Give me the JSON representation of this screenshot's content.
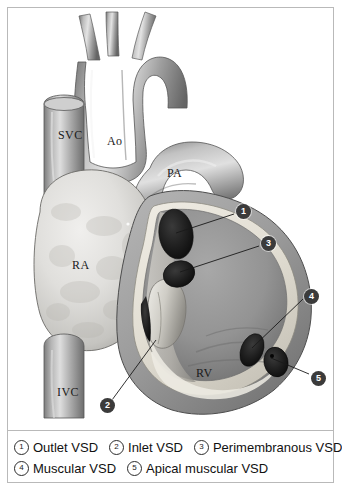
{
  "figure": {
    "frame_color": "#b9b9b9",
    "background": "#ffffff"
  },
  "anatomy_labels": [
    {
      "id": "svc",
      "text": "SVC",
      "x": 58,
      "y": 128
    },
    {
      "id": "ao",
      "text": "Ao",
      "x": 107,
      "y": 134
    },
    {
      "id": "pa",
      "text": "PA",
      "x": 167,
      "y": 166
    },
    {
      "id": "ra",
      "text": "RA",
      "x": 72,
      "y": 258
    },
    {
      "id": "ivc",
      "text": "IVC",
      "x": 57,
      "y": 385
    },
    {
      "id": "rv",
      "text": "RV",
      "x": 196,
      "y": 366
    }
  ],
  "callouts": [
    {
      "num": "1",
      "x": 236,
      "y": 204,
      "line": {
        "x1": 234,
        "y1": 214,
        "x2": 176,
        "y2": 233
      }
    },
    {
      "num": "2",
      "x": 100,
      "y": 398,
      "line": {
        "x1": 112,
        "y1": 400,
        "x2": 156,
        "y2": 340
      }
    },
    {
      "num": "3",
      "x": 261,
      "y": 236,
      "line": {
        "x1": 259,
        "y1": 246,
        "x2": 180,
        "y2": 272
      }
    },
    {
      "num": "4",
      "x": 304,
      "y": 289,
      "line": {
        "x1": 303,
        "y1": 299,
        "x2": 252,
        "y2": 348
      }
    },
    {
      "num": "5",
      "x": 311,
      "y": 371,
      "line": {
        "x1": 309,
        "y1": 374,
        "x2": 271,
        "y2": 358
      }
    }
  ],
  "legend": {
    "rows": [
      [
        {
          "num": "1",
          "label": "Outlet VSD"
        },
        {
          "num": "2",
          "label": "Inlet VSD"
        },
        {
          "num": "3",
          "label": "Perimembranous VSD"
        }
      ],
      [
        {
          "num": "4",
          "label": "Muscular VSD"
        },
        {
          "num": "5",
          "label": "Apical muscular VSD"
        }
      ]
    ]
  },
  "colors": {
    "vessel_light": "#d8d8d8",
    "vessel_mid": "#9a9a9a",
    "vessel_dark": "#5e5e5e",
    "atrium_light": "#e2e2e2",
    "myocardium": "#a3a3a3",
    "endocardium": "#e8e6e0",
    "cavity": "#8f8f8f",
    "defect": "#1e1e1e",
    "outline": "#4a4a4a",
    "text": "#111111"
  }
}
